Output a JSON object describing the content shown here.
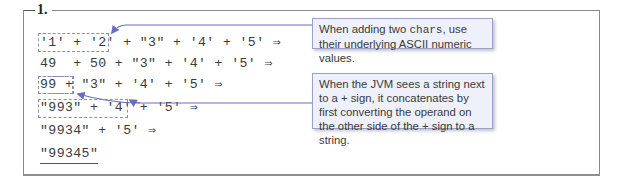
{
  "figure": {
    "number_label": "1.",
    "rows": [
      {
        "text": "'1' + '2' + \"3\" + '4' + '5' ⇒"
      },
      {
        "text": "49  + 50 + \"3\" + '4' + '5' ⇒"
      },
      {
        "text": "99 + \"3\" + '4' + '5' ⇒"
      },
      {
        "text": "\"993\" + '4' + '5' ⇒"
      },
      {
        "text": "\"9934\" + '5' ⇒"
      },
      {
        "text": "\"99345\""
      }
    ],
    "callouts": [
      {
        "text_before": "When adding two ",
        "code": "chars",
        "text_after": ", use their underlying ASCII numeric values."
      },
      {
        "text": "When the JVM sees a string next to a + sign, it concatenates by first converting the operand on the other side of the + sign to a string."
      }
    ],
    "colors": {
      "arrow": "#6a6fc0",
      "callout_bg": "#eef0fb",
      "callout_border": "#9aa0c8",
      "frame": "#8a8a8a",
      "text": "#3a3a3a"
    }
  }
}
